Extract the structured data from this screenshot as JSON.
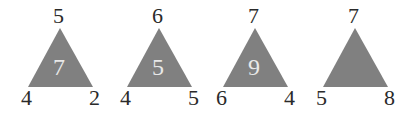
{
  "puzzle": {
    "fill_color": "#808080",
    "triangles": [
      {
        "top": "5",
        "left": "4",
        "right": "2",
        "center": "7"
      },
      {
        "top": "6",
        "left": "4",
        "right": "5",
        "center": "5"
      },
      {
        "top": "7",
        "left": "6",
        "right": "4",
        "center": "9"
      },
      {
        "top": "7",
        "left": "5",
        "right": "8",
        "center": ""
      }
    ]
  }
}
